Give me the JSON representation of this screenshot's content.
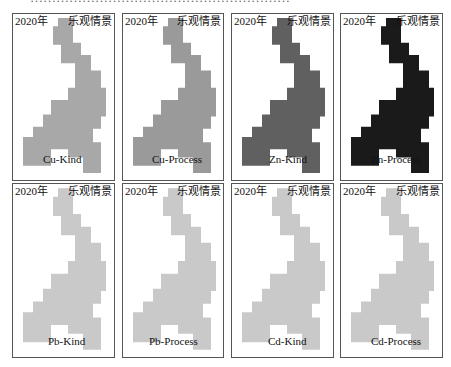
{
  "header_fragment": "……………………………………………………",
  "panels": [
    {
      "year": "2020年",
      "scenario": "乐观情景",
      "label": "Cu-Kind",
      "fill": "#a8a8a8",
      "x": 12,
      "y": 13,
      "w": 103,
      "h": 168,
      "lx": 42,
      "ly": 152
    },
    {
      "year": "2020年",
      "scenario": "乐观情景",
      "label": "Cu-Process",
      "fill": "#9a9a9a",
      "x": 122,
      "y": 13,
      "w": 102,
      "h": 168,
      "lx": 151,
      "ly": 152
    },
    {
      "year": "2020年",
      "scenario": "乐观情景",
      "label": "Zn-Kind",
      "fill": "#606060",
      "x": 231,
      "y": 13,
      "w": 103,
      "h": 168,
      "lx": 268,
      "ly": 152
    },
    {
      "year": "2020年",
      "scenario": "乐观情景",
      "label": "Zn-Process",
      "fill": "#1a1a1a",
      "x": 340,
      "y": 13,
      "w": 103,
      "h": 168,
      "lx": 370,
      "ly": 152
    },
    {
      "year": "2020年",
      "scenario": "乐观情景",
      "label": "Pb-Kind",
      "fill": "#c9c9c9",
      "x": 12,
      "y": 183,
      "w": 103,
      "h": 175,
      "lx": 47,
      "ly": 334
    },
    {
      "year": "2020年",
      "scenario": "乐观情景",
      "label": "Pb-Process",
      "fill": "#c9c9c9",
      "x": 122,
      "y": 183,
      "w": 102,
      "h": 175,
      "lx": 148,
      "ly": 334
    },
    {
      "year": "2020年",
      "scenario": "乐观情景",
      "label": "Cd-Kind",
      "fill": "#c9c9c9",
      "x": 231,
      "y": 183,
      "w": 103,
      "h": 175,
      "lx": 267,
      "ly": 334
    },
    {
      "year": "2020年",
      "scenario": "乐观情景",
      "label": "Cd-Process",
      "fill": "#c9c9c9",
      "x": 340,
      "y": 183,
      "w": 103,
      "h": 175,
      "lx": 370,
      "ly": 334
    }
  ]
}
